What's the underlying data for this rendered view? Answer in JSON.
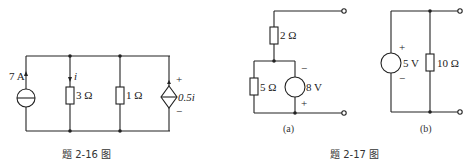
{
  "fig216": {
    "caption": "题 2-16 图",
    "current_source": "7 A",
    "current_label": "i",
    "r1": "3 Ω",
    "r2": "1 Ω",
    "dep_source": "0.5i",
    "plus": "+",
    "minus": "−"
  },
  "fig217": {
    "caption": "题 2-17 图",
    "a": {
      "label": "(a)",
      "r_top": "2 Ω",
      "r_left": "5 Ω",
      "vsource": "8 V",
      "minus": "−",
      "plus": "+"
    },
    "b": {
      "label": "(b)",
      "vsource": "5 V",
      "r": "10 Ω",
      "plus": "+",
      "minus": "−"
    }
  }
}
